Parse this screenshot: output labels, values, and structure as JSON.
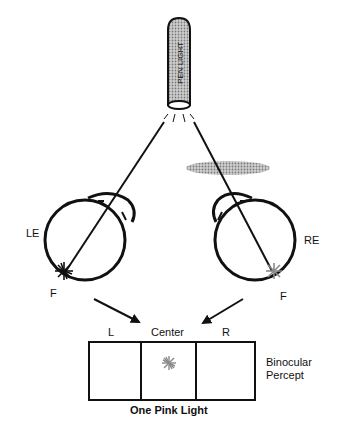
{
  "pen_light": {
    "label": "PEN LIGHT"
  },
  "left_eye": {
    "label": "LE",
    "fovea_label": "F"
  },
  "right_eye": {
    "label": "RE",
    "fovea_label": "F"
  },
  "percept": {
    "regions": [
      "L",
      "Center",
      "R"
    ],
    "side_label_line1": "Binocular",
    "side_label_line2": "Percept",
    "caption": "One Pink Light"
  },
  "colors": {
    "line": "#111111",
    "filter": "#9a9a9a",
    "pink_light": "#8a8a8a",
    "pen_body": "#bdbdbd"
  }
}
